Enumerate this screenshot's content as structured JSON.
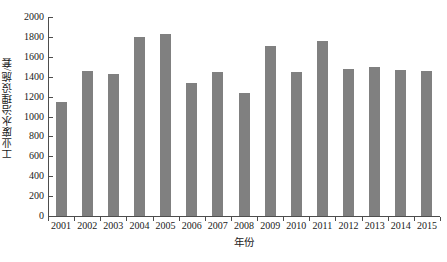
{
  "chart_data": {
    "type": "bar",
    "title": "",
    "xlabel": "年份",
    "ylabel": "工业废水治理设施/套",
    "categories": [
      "2001",
      "2002",
      "2003",
      "2004",
      "2005",
      "2006",
      "2007",
      "2008",
      "2009",
      "2010",
      "2011",
      "2012",
      "2013",
      "2014",
      "2015"
    ],
    "values": [
      1150,
      1455,
      1425,
      1800,
      1825,
      1340,
      1450,
      1235,
      1710,
      1450,
      1760,
      1480,
      1495,
      1470,
      1455
    ],
    "series": [
      {
        "name": "工业废水治理设施",
        "values": [
          1150,
          1455,
          1425,
          1800,
          1825,
          1340,
          1450,
          1235,
          1710,
          1450,
          1760,
          1480,
          1495,
          1470,
          1455
        ]
      }
    ],
    "ylim": [
      0,
      2000
    ],
    "ytick_step": 200,
    "yticks": [
      0,
      200,
      400,
      600,
      800,
      1000,
      1200,
      1400,
      1600,
      1800,
      2000
    ],
    "ytick_labels": [
      "0",
      "200",
      "400",
      "600",
      "800",
      "1000",
      "1200",
      "1400",
      "1600",
      "1800",
      "2000"
    ],
    "grid": false,
    "legend": null,
    "bar_color": "#808080",
    "axis_color": "#4d4d4d",
    "background": "#ffffff"
  }
}
